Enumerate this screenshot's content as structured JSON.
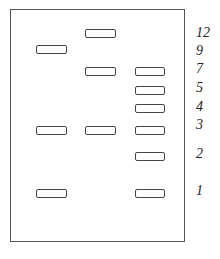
{
  "diagram": {
    "type": "gel-electrophoresis",
    "lanes": [
      {
        "name": "lane-1",
        "bands_at": [
          "9",
          "3",
          "1"
        ]
      },
      {
        "name": "lane-2",
        "bands_at": [
          "12",
          "7",
          "3"
        ]
      },
      {
        "name": "lane-3",
        "bands_at": [
          "7",
          "5",
          "4",
          "3",
          "2",
          "1"
        ]
      }
    ],
    "size_markers": [
      {
        "label": "12",
        "y": 29
      },
      {
        "label": "9",
        "y": 45
      },
      {
        "label": "7",
        "y": 62
      },
      {
        "label": "5",
        "y": 80
      },
      {
        "label": "4",
        "y": 98
      },
      {
        "label": "3",
        "y": 119
      },
      {
        "label": "2",
        "y": 147
      },
      {
        "label": "1",
        "y": 184
      }
    ]
  }
}
